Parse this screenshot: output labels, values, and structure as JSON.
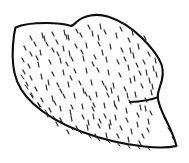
{
  "image": {
    "domain": "Natural-Image",
    "subject_name": "wide-brimmed hat",
    "style": "black and white line drawing",
    "alt_text": "Line drawing of a wide-brimmed straw sun hat seen from a three-quarter angle, with stippled straw texture",
    "background_color": "#ffffff",
    "line_color": "#0d0d0d",
    "texture_color": "#2e2e2e",
    "canvas_width": 189,
    "canvas_height": 163
  },
  "shapes": {
    "hat_outline_path": "M 15.5 27.5 C 22 24.5 34 23.0 46 23.0 C 56 23.0 64 23.6 69.5 25.6 C 72.5 26.6 73.5 25.0 76.5 22.0 C 83.5 15.5 96 12.8 108.5 16.8 C 121 20.8 132.5 28.5 142.5 38.5 C 152 48 158.5 56.5 161.5 64.5 C 164 71.5 162.5 79.5 160.0 86.5 C 158.6 90.5 157.6 94.0 157.8 97.2 C 158.2 103.0 161.5 111.0 166.0 120.0 C 170.5 129.0 174.5 138.5 176.5 146.0 C 170.0 147.5 158.0 148.0 144.0 146.5 C 124.0 144.4 101.0 139.0 81.0 131.5 C 61.0 124.0 45.0 114.5 33.0 103.5 C 23.0 94.3 17.0 84.0 14.5 73.0 C 12.2 62.5 12.3 48.0 14.0 35.0 Z",
    "crown_divider_path": "M 157.9 97.1 C 152.0 99.5 142.0 101.5 130.0 102.0",
    "texture_marks": [
      [
        34,
        42,
        36,
        46
      ],
      [
        44,
        36,
        45,
        41
      ],
      [
        56,
        40,
        58,
        44
      ],
      [
        68,
        35,
        69,
        40
      ],
      [
        80,
        33,
        82,
        37
      ],
      [
        92,
        31,
        93,
        36
      ],
      [
        104,
        30,
        106,
        34
      ],
      [
        116,
        33,
        117,
        38
      ],
      [
        128,
        38,
        130,
        42
      ],
      [
        138,
        44,
        139,
        49
      ],
      [
        148,
        52,
        150,
        56
      ],
      [
        30,
        52,
        32,
        56
      ],
      [
        40,
        50,
        41,
        55
      ],
      [
        52,
        48,
        54,
        52
      ],
      [
        63,
        46,
        64,
        51
      ],
      [
        75,
        44,
        77,
        48
      ],
      [
        86,
        43,
        87,
        48
      ],
      [
        98,
        42,
        100,
        46
      ],
      [
        110,
        44,
        111,
        49
      ],
      [
        121,
        48,
        123,
        52
      ],
      [
        133,
        53,
        134,
        58
      ],
      [
        143,
        60,
        145,
        64
      ],
      [
        153,
        66,
        154,
        71
      ],
      [
        28,
        64,
        30,
        68
      ],
      [
        38,
        62,
        39,
        67
      ],
      [
        49,
        60,
        51,
        64
      ],
      [
        60,
        58,
        61,
        63
      ],
      [
        71,
        57,
        73,
        61
      ],
      [
        83,
        56,
        84,
        61
      ],
      [
        94,
        55,
        96,
        59
      ],
      [
        106,
        57,
        107,
        62
      ],
      [
        117,
        60,
        119,
        64
      ],
      [
        128,
        65,
        129,
        70
      ],
      [
        139,
        71,
        141,
        75
      ],
      [
        149,
        78,
        150,
        83
      ],
      [
        30,
        76,
        32,
        80
      ],
      [
        41,
        74,
        42,
        79
      ],
      [
        52,
        72,
        54,
        76
      ],
      [
        63,
        70,
        64,
        75
      ],
      [
        74,
        69,
        76,
        73
      ],
      [
        86,
        68,
        87,
        73
      ],
      [
        97,
        68,
        99,
        72
      ],
      [
        108,
        70,
        109,
        75
      ],
      [
        119,
        73,
        121,
        77
      ],
      [
        130,
        78,
        131,
        83
      ],
      [
        141,
        84,
        143,
        88
      ],
      [
        151,
        90,
        152,
        95
      ],
      [
        35,
        87,
        37,
        91
      ],
      [
        46,
        85,
        47,
        90
      ],
      [
        57,
        83,
        59,
        87
      ],
      [
        68,
        82,
        69,
        87
      ],
      [
        79,
        81,
        81,
        85
      ],
      [
        91,
        80,
        92,
        85
      ],
      [
        102,
        81,
        104,
        85
      ],
      [
        113,
        83,
        114,
        88
      ],
      [
        124,
        87,
        126,
        91
      ],
      [
        135,
        92,
        136,
        97
      ],
      [
        145,
        98,
        147,
        102
      ],
      [
        41,
        98,
        43,
        102
      ],
      [
        52,
        96,
        53,
        101
      ],
      [
        63,
        94,
        65,
        98
      ],
      [
        74,
        93,
        75,
        98
      ],
      [
        85,
        92,
        87,
        96
      ],
      [
        96,
        92,
        97,
        97
      ],
      [
        107,
        93,
        109,
        97
      ],
      [
        118,
        96,
        119,
        101
      ],
      [
        129,
        100,
        131,
        104
      ],
      [
        140,
        105,
        141,
        110
      ],
      [
        150,
        111,
        152,
        115
      ],
      [
        49,
        108,
        51,
        112
      ],
      [
        60,
        106,
        61,
        111
      ],
      [
        71,
        105,
        73,
        109
      ],
      [
        82,
        104,
        83,
        109
      ],
      [
        93,
        103,
        95,
        107
      ],
      [
        104,
        103,
        105,
        108
      ],
      [
        115,
        105,
        117,
        109
      ],
      [
        126,
        108,
        127,
        113
      ],
      [
        137,
        113,
        139,
        117
      ],
      [
        148,
        119,
        149,
        124
      ],
      [
        60,
        118,
        62,
        122
      ],
      [
        71,
        116,
        72,
        121
      ],
      [
        82,
        115,
        84,
        119
      ],
      [
        93,
        114,
        94,
        119
      ],
      [
        104,
        114,
        106,
        118
      ],
      [
        115,
        115,
        116,
        120
      ],
      [
        126,
        118,
        128,
        122
      ],
      [
        137,
        122,
        138,
        127
      ],
      [
        147,
        128,
        149,
        132
      ],
      [
        76,
        126,
        78,
        130
      ],
      [
        87,
        125,
        88,
        130
      ],
      [
        98,
        124,
        100,
        128
      ],
      [
        109,
        124,
        110,
        129
      ],
      [
        120,
        126,
        122,
        130
      ],
      [
        131,
        129,
        132,
        134
      ],
      [
        142,
        134,
        144,
        138
      ],
      [
        95,
        134,
        97,
        138
      ],
      [
        106,
        133,
        107,
        138
      ],
      [
        117,
        134,
        119,
        138
      ],
      [
        128,
        137,
        129,
        142
      ],
      [
        139,
        141,
        141,
        145
      ],
      [
        24,
        46,
        26,
        50
      ],
      [
        22,
        58,
        24,
        62
      ],
      [
        23,
        70,
        25,
        74
      ],
      [
        26,
        82,
        28,
        86
      ],
      [
        31,
        93,
        33,
        97
      ],
      [
        38,
        103,
        40,
        107
      ],
      [
        46,
        113,
        48,
        117
      ],
      [
        56,
        122,
        58,
        126
      ],
      [
        67,
        130,
        69,
        134
      ],
      [
        88,
        120,
        89,
        125
      ],
      [
        99,
        119,
        101,
        123
      ],
      [
        110,
        120,
        111,
        125
      ],
      [
        46,
        42,
        48,
        46
      ],
      [
        36,
        56,
        38,
        60
      ],
      [
        66,
        62,
        68,
        66
      ],
      [
        89,
        96,
        91,
        100
      ],
      [
        111,
        88,
        112,
        93
      ],
      [
        134,
        76,
        135,
        81
      ],
      [
        155,
        58,
        156,
        63
      ],
      [
        144,
        36,
        146,
        40
      ],
      [
        132,
        30,
        133,
        35
      ],
      [
        120,
        27,
        122,
        31
      ],
      [
        100,
        24,
        101,
        29
      ],
      [
        88,
        25,
        90,
        29
      ],
      [
        76,
        29,
        78,
        33
      ],
      [
        64,
        30,
        65,
        35
      ],
      [
        52,
        32,
        54,
        36
      ],
      [
        42,
        33,
        43,
        38
      ],
      [
        30,
        36,
        32,
        40
      ],
      [
        57,
        52,
        59,
        56
      ],
      [
        69,
        51,
        70,
        56
      ],
      [
        81,
        50,
        83,
        54
      ],
      [
        102,
        50,
        103,
        55
      ],
      [
        124,
        57,
        126,
        61
      ],
      [
        146,
        70,
        147,
        75
      ],
      [
        136,
        63,
        138,
        67
      ],
      [
        92,
        62,
        94,
        66
      ],
      [
        70,
        76,
        72,
        80
      ],
      [
        48,
        80,
        49,
        85
      ],
      [
        60,
        89,
        62,
        93
      ],
      [
        83,
        88,
        84,
        93
      ],
      [
        105,
        86,
        107,
        90
      ],
      [
        127,
        93,
        128,
        98
      ],
      [
        145,
        106,
        146,
        111
      ],
      [
        114,
        101,
        115,
        106
      ],
      [
        92,
        107,
        94,
        111
      ],
      [
        70,
        110,
        71,
        115
      ],
      [
        54,
        101,
        56,
        105
      ],
      [
        66,
        35,
        67,
        39
      ],
      [
        98,
        35,
        99,
        40
      ],
      [
        130,
        48,
        131,
        53
      ],
      [
        152,
        84,
        153,
        89
      ],
      [
        156,
        72,
        157,
        77
      ]
    ],
    "edge_ticks": [
      [
        38,
        103,
        41,
        107
      ],
      [
        45,
        110,
        48,
        114
      ],
      [
        53,
        116,
        56,
        120
      ],
      [
        61,
        121,
        64,
        125
      ],
      [
        70,
        126,
        73,
        130
      ],
      [
        79,
        130,
        82,
        134
      ],
      [
        88,
        134,
        91,
        138
      ],
      [
        97,
        137,
        100,
        141
      ],
      [
        107,
        140,
        110,
        143
      ],
      [
        117,
        142,
        120,
        146
      ],
      [
        127,
        144,
        130,
        148
      ],
      [
        137,
        145,
        140,
        149
      ],
      [
        147,
        146,
        150,
        150
      ],
      [
        30,
        94,
        33,
        98
      ],
      [
        25,
        85,
        28,
        89
      ],
      [
        21,
        75,
        24,
        79
      ],
      [
        160,
        108,
        163,
        112
      ],
      [
        164,
        118,
        167,
        122
      ],
      [
        168,
        128,
        171,
        132
      ],
      [
        172,
        137,
        175,
        141
      ]
    ]
  }
}
